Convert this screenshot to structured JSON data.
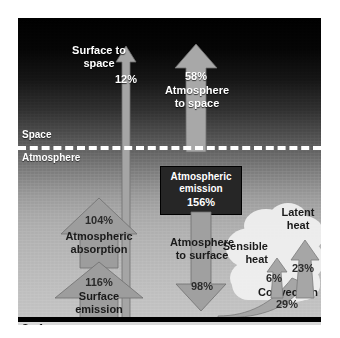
{
  "figure": {
    "zones": [
      {
        "name": "space",
        "label": "Space"
      },
      {
        "name": "atmosphere",
        "label": "Atmosphere"
      },
      {
        "name": "surface",
        "label": "Surface"
      }
    ],
    "flows": [
      {
        "id": "surface-to-space",
        "label": "Surface to\nspace",
        "value": "12%",
        "direction": "up",
        "color": "#9e9e9e"
      },
      {
        "id": "atmosphere-to-space",
        "label": "Atmosphere\nto space",
        "value": "58%",
        "direction": "up",
        "color": "#9e9e9e"
      },
      {
        "id": "atmospheric-emission",
        "label": "Atmospheric\nemission",
        "value": "156%",
        "direction": "box",
        "color": "#262626"
      },
      {
        "id": "atmospheric-absorption",
        "label": "Atmospheric\nabsorption",
        "value": "104%",
        "direction": "up",
        "color": "#9a9a9a"
      },
      {
        "id": "surface-emission",
        "label": "Surface\nemission",
        "value": "116%",
        "direction": "up",
        "color": "#9a9a9a"
      },
      {
        "id": "atmosphere-to-surface",
        "label": "Atmosphere\nto surface",
        "value": "98%",
        "direction": "down",
        "color": "#9a9a9a"
      },
      {
        "id": "latent-heat",
        "label": "Latent\nheat",
        "value": "23%",
        "direction": "up",
        "color": "#a2a2a2"
      },
      {
        "id": "sensible-heat",
        "label": "Sensible\nheat",
        "value": "6%",
        "direction": "up",
        "color": "#a2a2a2"
      },
      {
        "id": "convection",
        "label": "Convection",
        "value": "29%",
        "direction": "up",
        "color": "#a2a2a2"
      }
    ],
    "colors": {
      "sky_top": "#000000",
      "sky_bottom": "#c4c4c4",
      "arrow_fill": "#9a9a9a",
      "arrow_stroke": "#5a5a5a",
      "boundary": "#ffffff",
      "surface_bar": "#000000",
      "emission_box": "#262626"
    }
  }
}
